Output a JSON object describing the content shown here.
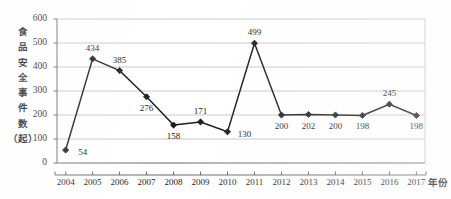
{
  "chart_data": {
    "type": "line",
    "title": "",
    "xlabel": "年份",
    "ylabel": "食品安全事件数（起）",
    "ylabel_chars": [
      "食",
      "品",
      "安",
      "全",
      "事",
      "件",
      "数",
      "（起）"
    ],
    "categories": [
      "2004",
      "2005",
      "2006",
      "2007",
      "2008",
      "2009",
      "2010",
      "2011",
      "2012",
      "2013",
      "2014",
      "2015",
      "2016",
      "2017"
    ],
    "values": [
      54,
      434,
      385,
      276,
      158,
      171,
      130,
      499,
      200,
      202,
      200,
      198,
      245,
      198
    ],
    "point_labels": [
      "54",
      "434",
      "385",
      "276",
      "158",
      "171",
      "130",
      "499",
      "200",
      "202",
      "200",
      "198",
      "245",
      "198"
    ],
    "label_positions": [
      "right",
      "above",
      "above",
      "below",
      "below",
      "above",
      "right",
      "above",
      "below",
      "below",
      "below",
      "below",
      "above",
      "below"
    ],
    "yticks": [
      "0",
      "100",
      "200",
      "300",
      "400",
      "500",
      "600"
    ],
    "ylim": [
      0,
      600
    ],
    "ytick_step": 100,
    "grid": true,
    "legend": "none",
    "series_color": "#1a1a1a",
    "grid_color": "#b9b9bd",
    "axis_color": "#55555a",
    "marker": "diamond"
  }
}
